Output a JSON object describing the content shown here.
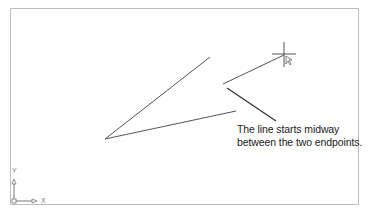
{
  "annotation": {
    "line1": "The line starts midway",
    "line2": "between the two endpoints."
  },
  "ucs_icon": {
    "x_label": "X",
    "y_label": "Y"
  },
  "colors": {
    "line": "#555555",
    "frame": "#bdbdbd",
    "text": "#222222"
  }
}
